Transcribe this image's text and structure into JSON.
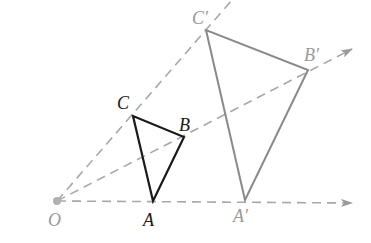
{
  "diagram": {
    "type": "dilation",
    "center": {
      "label": "O",
      "x": 57,
      "y": 201
    },
    "original_triangle": {
      "color": "#1a1a1a",
      "vertices": [
        {
          "label": "A",
          "x": 153,
          "y": 201
        },
        {
          "label": "B",
          "x": 184,
          "y": 137
        },
        {
          "label": "C",
          "x": 133,
          "y": 116
        }
      ]
    },
    "image_triangle": {
      "color": "#8a8a8a",
      "vertices": [
        {
          "label": "A′",
          "x": 245,
          "y": 200
        },
        {
          "label": "B′",
          "x": 308,
          "y": 70
        },
        {
          "label": "C′",
          "x": 206,
          "y": 30
        }
      ]
    },
    "rays": [
      {
        "name": "ray-OA",
        "from": "O",
        "through": "A′",
        "arrow": true
      },
      {
        "name": "ray-OB",
        "from": "O",
        "through": "B′",
        "arrow": true
      },
      {
        "name": "ray-OC",
        "from": "O",
        "through": "C′",
        "arrow": false
      }
    ],
    "ray_color": "#a8a8a8"
  },
  "labels": {
    "O": "O",
    "A": "A",
    "B": "B",
    "C": "C",
    "A_prime": "A′",
    "B_prime": "B′",
    "C_prime": "C′"
  }
}
